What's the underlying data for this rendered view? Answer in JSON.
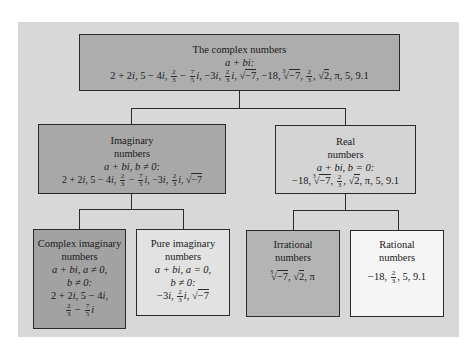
{
  "diagram": {
    "colors": {
      "panel": "#d8d8d8",
      "complex": "#adadad",
      "imaginary": "#a8a8a8",
      "real": "#d4d4d4",
      "complex_imaginary": "#a2a2a2",
      "pure_imaginary": "#e2e2e2",
      "irrational": "#b4b4b4",
      "rational": "#f5f5f5",
      "line": "#2a2a2a"
    },
    "nodes": {
      "complex": {
        "title": "The complex numbers",
        "condition": "a + bi:",
        "examples": "2 + 2i, 5 − 4i, 2/3 − 7/5 i, −3i, 2/3 i, √−7, −18, ∛−7, 2/3, √2, π, 5, 9.1"
      },
      "imaginary": {
        "title_line1": "Imaginary",
        "title_line2": "numbers",
        "condition": "a + bi, b ≠ 0:",
        "examples": "2 + 2i, 5 − 4i, 2/3 − 7/5 i, −3i, 2/3 i, √−7"
      },
      "real": {
        "title_line1": "Real",
        "title_line2": "numbers",
        "condition": "a + bi, b = 0:",
        "examples": "−18, ∛−7, 2/3, √2, π, 5, 9.1"
      },
      "complex_imaginary": {
        "title_line1": "Complex imaginary",
        "title_line2": "numbers",
        "condition_line1": "a + bi, a ≠ 0,",
        "condition_line2": "b ≠ 0:",
        "examples_line1": "2 + 2i, 5 − 4i,",
        "examples_line2": "2/3 − 7/5 i"
      },
      "pure_imaginary": {
        "title_line1": "Pure imaginary",
        "title_line2": "numbers",
        "condition_line1": "a + bi, a = 0,",
        "condition_line2": "b ≠ 0:",
        "examples": "−3i, 2/3 i, √−7"
      },
      "irrational": {
        "title_line1": "Irrational",
        "title_line2": "numbers",
        "examples": "∛−7, √2, π"
      },
      "rational": {
        "title_line1": "Rational",
        "title_line2": "numbers",
        "examples": "−18, 2/3, 5, 9.1"
      }
    },
    "edges": [
      {
        "from": "complex",
        "to": "imaginary"
      },
      {
        "from": "complex",
        "to": "real"
      },
      {
        "from": "imaginary",
        "to": "complex_imaginary"
      },
      {
        "from": "imaginary",
        "to": "pure_imaginary"
      },
      {
        "from": "real",
        "to": "irrational"
      },
      {
        "from": "real",
        "to": "rational"
      }
    ],
    "glyphs": {
      "plus": "+",
      "minus": "−",
      "neq": "≠",
      "eq": "=",
      "pi": "π",
      "sqrt": "√",
      "cbrt_index": "3",
      "frac_2": "2",
      "frac_3": "3",
      "frac_7": "7",
      "frac_5": "5"
    }
  }
}
